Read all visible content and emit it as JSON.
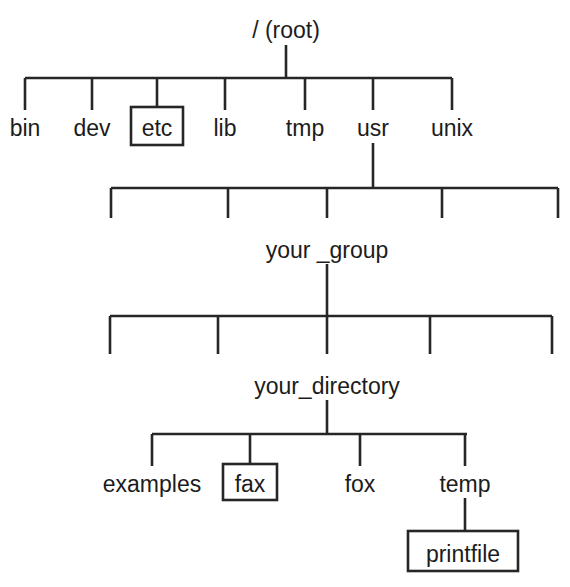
{
  "diagram": {
    "type": "tree",
    "stroke_color": "#262626",
    "text_color": "#1c1c1c",
    "background_color": "#ffffff"
  },
  "nodes": {
    "root": {
      "label": "/ (root)",
      "boxed": false
    },
    "bin": {
      "label": "bin",
      "boxed": false
    },
    "dev": {
      "label": "dev",
      "boxed": false
    },
    "etc": {
      "label": "etc",
      "boxed": true
    },
    "lib": {
      "label": "lib",
      "boxed": false
    },
    "tmp": {
      "label": "tmp",
      "boxed": false
    },
    "usr": {
      "label": "usr",
      "boxed": false
    },
    "unix": {
      "label": "unix",
      "boxed": false
    },
    "your_group": {
      "label": "your _group",
      "boxed": false
    },
    "your_directory": {
      "label": "your_directory",
      "boxed": false
    },
    "examples": {
      "label": "examples",
      "boxed": false
    },
    "fax": {
      "label": "fax",
      "boxed": true
    },
    "fox": {
      "label": "fox",
      "boxed": false
    },
    "temp": {
      "label": "temp",
      "boxed": false
    },
    "printfile": {
      "label": "printfile",
      "boxed": true
    }
  },
  "levels": [
    {
      "name": "root-level",
      "labels": [
        "/ (root)"
      ]
    },
    {
      "name": "root-children",
      "labels": [
        "bin",
        "dev",
        "etc",
        "lib",
        "tmp",
        "usr",
        "unix"
      ]
    },
    {
      "name": "usr-children",
      "labels": [
        "",
        "",
        "your _group",
        "",
        ""
      ]
    },
    {
      "name": "your-group-children",
      "labels": [
        "",
        "",
        "your_directory",
        "",
        ""
      ]
    },
    {
      "name": "your-directory-children",
      "labels": [
        "examples",
        "fax",
        "fox",
        "temp"
      ]
    },
    {
      "name": "temp-children",
      "labels": [
        "printfile"
      ]
    }
  ]
}
